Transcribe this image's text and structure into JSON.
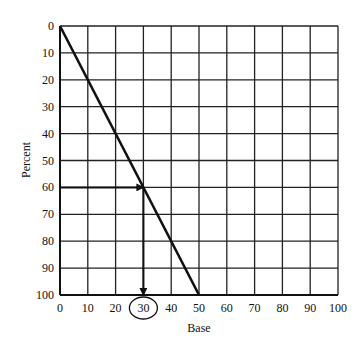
{
  "chart_data": {
    "type": "line",
    "title": "",
    "xlabel": "Base",
    "ylabel": "Percent",
    "x_ticks": [
      "0",
      "10",
      "20",
      "30",
      "40",
      "50",
      "60",
      "70",
      "80",
      "90",
      "100"
    ],
    "y_ticks": [
      "0",
      "10",
      "20",
      "30",
      "40",
      "50",
      "60",
      "70",
      "80",
      "90",
      "100"
    ],
    "xlim": [
      0,
      100
    ],
    "ylim": [
      0,
      100
    ],
    "y_axis_inverted": true,
    "grid": true,
    "series": [
      {
        "name": "line",
        "x": [
          0,
          50
        ],
        "y": [
          0,
          100
        ]
      }
    ],
    "annotations": [
      {
        "type": "arrow",
        "from": [
          0,
          60
        ],
        "to": [
          30,
          60
        ],
        "label": "Percent 60 to line"
      },
      {
        "type": "arrow",
        "from": [
          30,
          60
        ],
        "to": [
          30,
          100
        ],
        "label": "down to Base 30"
      },
      {
        "type": "circle",
        "target": "x_tick_30"
      }
    ],
    "highlighted_x_tick": "30"
  }
}
